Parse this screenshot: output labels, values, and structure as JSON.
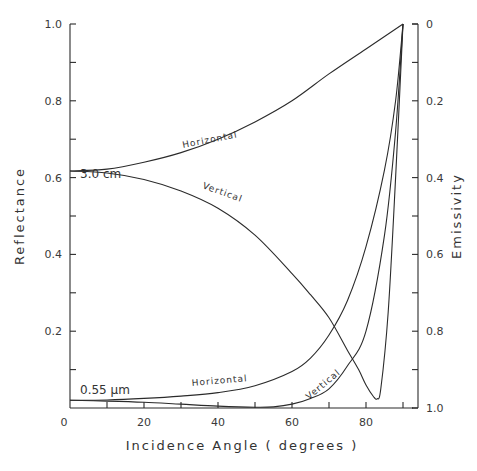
{
  "chart_data": {
    "type": "line",
    "title": "",
    "xlabel": "Incidence Angle ( degrees )",
    "ylabel": "Reflectance",
    "y2label": "Emissivity",
    "xlim": [
      0,
      90
    ],
    "ylim": [
      0,
      1.0
    ],
    "y2lim": [
      1.0,
      0
    ],
    "x_ticks": [
      0,
      20,
      40,
      60,
      80
    ],
    "x_tick_labels": [
      "0",
      "20",
      "40",
      "60",
      "80"
    ],
    "y_ticks": [
      0.2,
      0.4,
      0.6,
      0.8,
      1.0
    ],
    "y_tick_labels": [
      "0.2",
      "0.4",
      "0.6",
      "0.8",
      "1.0"
    ],
    "y2_ticks": [
      0,
      0.2,
      0.4,
      0.6,
      0.8,
      1.0
    ],
    "y2_tick_labels": [
      "0",
      "0.2",
      "0.4",
      "0.6",
      "0.8",
      "1.0"
    ],
    "grid": false,
    "legend": "inline labels",
    "annotations": [
      "3.0 cm",
      "0.55 µm",
      "Horizontal",
      "Vertical",
      "Horizontal",
      "Vertical"
    ],
    "series": [
      {
        "name": "3.0 cm Horizontal",
        "x": [
          0,
          10,
          20,
          30,
          40,
          50,
          60,
          70,
          80,
          90
        ],
        "values": [
          0.617,
          0.622,
          0.64,
          0.665,
          0.7,
          0.745,
          0.8,
          0.87,
          0.935,
          1.0
        ]
      },
      {
        "name": "3.0 cm Vertical",
        "x": [
          0,
          10,
          20,
          30,
          40,
          50,
          60,
          65,
          70,
          75,
          78,
          80,
          82,
          83,
          84,
          86,
          88,
          90
        ],
        "values": [
          0.617,
          0.612,
          0.595,
          0.565,
          0.52,
          0.45,
          0.35,
          0.295,
          0.235,
          0.15,
          0.1,
          0.06,
          0.03,
          0.024,
          0.05,
          0.25,
          0.6,
          1.0
        ]
      },
      {
        "name": "0.55 µm Horizontal",
        "x": [
          0,
          10,
          20,
          30,
          40,
          50,
          60,
          65,
          70,
          75,
          80,
          85,
          88,
          90
        ],
        "values": [
          0.02,
          0.021,
          0.025,
          0.031,
          0.04,
          0.058,
          0.095,
          0.13,
          0.19,
          0.28,
          0.42,
          0.62,
          0.8,
          1.0
        ]
      },
      {
        "name": "0.55 µm Vertical",
        "x": [
          0,
          10,
          20,
          30,
          40,
          50,
          55,
          60,
          65,
          70,
          75,
          80,
          85,
          88,
          90
        ],
        "values": [
          0.02,
          0.018,
          0.015,
          0.01,
          0.005,
          0.002,
          0.003,
          0.01,
          0.025,
          0.05,
          0.11,
          0.2,
          0.45,
          0.72,
          1.0
        ]
      }
    ]
  },
  "labels": {
    "series_30cm": "3.0 cm",
    "series_055um": "0.55 µm",
    "horizontal": "Horizontal",
    "vertical": "Vertical"
  }
}
